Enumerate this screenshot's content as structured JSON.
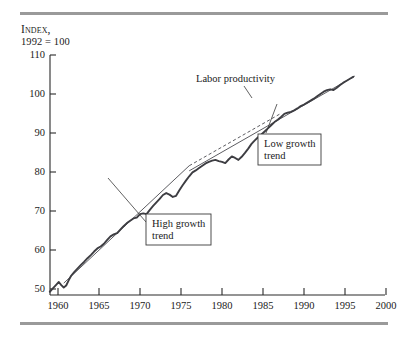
{
  "figure": {
    "top_rule": "rule",
    "bottom_rule": "rule"
  },
  "axis_caption": {
    "line1": "Index,",
    "line2": "1992 = 100"
  },
  "chart_data": {
    "type": "line",
    "title": "",
    "subtitle": "",
    "xlabel": "",
    "ylabel": "Index, 1992 = 100",
    "xlim": [
      1959,
      2000
    ],
    "ylim": [
      48,
      110
    ],
    "grid": false,
    "legend_position": "none",
    "x_ticks": [
      1960,
      1965,
      1970,
      1975,
      1980,
      1985,
      1990,
      1995,
      2000
    ],
    "y_ticks": [
      50,
      60,
      70,
      80,
      90,
      100,
      110
    ],
    "series": [
      {
        "name": "Labor productivity",
        "style": "solid-jagged",
        "color": "#3d3d42",
        "x": [
          1959.0,
          1959.4,
          1959.8,
          1960.1,
          1960.4,
          1960.7,
          1961.0,
          1961.3,
          1961.6,
          1962.0,
          1962.4,
          1962.8,
          1963.2,
          1963.6,
          1964.0,
          1964.4,
          1964.8,
          1965.2,
          1965.6,
          1966.0,
          1966.4,
          1966.8,
          1967.2,
          1967.6,
          1968.0,
          1968.4,
          1968.8,
          1969.2,
          1969.6,
          1970.0,
          1970.4,
          1970.8,
          1971.2,
          1971.6,
          1972.0,
          1972.4,
          1972.8,
          1973.2,
          1973.6,
          1974.0,
          1974.4,
          1974.8,
          1975.2,
          1975.6,
          1976.0,
          1976.4,
          1976.8,
          1977.2,
          1977.6,
          1978.0,
          1978.4,
          1978.8,
          1979.2,
          1979.6,
          1980.0,
          1980.4,
          1980.8,
          1981.2,
          1981.6,
          1982.0,
          1982.4,
          1982.8,
          1983.2,
          1983.6,
          1984.0,
          1984.4,
          1984.8,
          1985.2,
          1985.6,
          1986.0,
          1986.4,
          1986.8,
          1987.2,
          1987.6,
          1988.0,
          1988.4,
          1988.8,
          1989.2,
          1989.6,
          1990.0,
          1990.4,
          1990.8,
          1991.2,
          1991.6,
          1992.0,
          1992.4,
          1992.8,
          1993.2,
          1993.6,
          1994.0,
          1994.4,
          1994.8,
          1995.2,
          1995.6,
          1996.0
        ],
        "y": [
          49.3,
          50.2,
          51.1,
          51.8,
          51.0,
          50.4,
          50.9,
          52.2,
          53.4,
          54.4,
          55.3,
          56.2,
          57.0,
          57.9,
          58.7,
          59.6,
          60.4,
          60.9,
          61.6,
          62.6,
          63.5,
          64.0,
          64.3,
          65.2,
          66.1,
          66.9,
          67.5,
          68.1,
          68.3,
          69.2,
          69.4,
          69.2,
          70.3,
          71.3,
          72.2,
          73.1,
          74.1,
          74.6,
          74.2,
          73.6,
          73.9,
          75.3,
          76.6,
          77.8,
          78.9,
          79.9,
          80.4,
          81.0,
          81.6,
          82.2,
          82.6,
          82.9,
          83.1,
          82.8,
          82.6,
          82.3,
          83.2,
          84.0,
          83.6,
          83.1,
          83.9,
          84.9,
          86.0,
          87.2,
          88.1,
          88.9,
          89.6,
          90.4,
          91.2,
          92.0,
          92.8,
          93.4,
          94.1,
          94.9,
          95.2,
          95.4,
          95.8,
          96.3,
          96.9,
          97.3,
          97.8,
          98.3,
          98.8,
          99.4,
          100.0,
          100.6,
          101.0,
          101.2,
          101.0,
          101.6,
          102.3,
          102.9,
          103.4,
          103.9,
          104.4
        ]
      },
      {
        "name": "High growth trend",
        "style": "thin-line-with-dashed-extension",
        "color": "#4a4a4f",
        "fit_x": [
          1960.7,
          1976.0
        ],
        "fit_y": [
          51.5,
          81.6
        ],
        "extension_x": [
          1976.0,
          1987.0
        ],
        "extension_y": [
          81.6,
          94.8
        ]
      },
      {
        "name": "Low growth trend",
        "style": "thin-line",
        "color": "#4a4a4f",
        "fit_x": [
          1976.0,
          1996.2
        ],
        "fit_y": [
          80.3,
          104.6
        ]
      }
    ],
    "annotations": [
      {
        "id": "labor-productivity",
        "text": "Labor productivity",
        "boxed": false,
        "text_x": 196,
        "text_y": 81,
        "leader": "M 244,86 L 252,98"
      },
      {
        "id": "low-growth-trend",
        "text_lines": [
          "Low growth",
          "trend"
        ],
        "boxed": true,
        "box": {
          "x": 258,
          "y": 134,
          "w": 63,
          "h": 31
        },
        "leader": "M 264,133 L 276,105"
      },
      {
        "id": "high-growth-trend",
        "text_lines": [
          "High growth",
          "trend"
        ],
        "boxed": true,
        "box": {
          "x": 146,
          "y": 214,
          "w": 65,
          "h": 31
        },
        "leader": "M 146,222 L 108,178"
      }
    ]
  },
  "colors": {
    "rule": "#9a9a9a",
    "series": "#3d3d42",
    "trend": "#4a4a4f",
    "text": "#1a1a1a",
    "background": "#ffffff"
  }
}
